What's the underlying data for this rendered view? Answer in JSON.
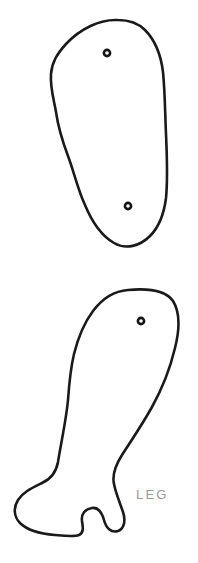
{
  "document": {
    "title": "LEG",
    "background_color": "#ffffff",
    "ink_color": "#1a1a1a",
    "label_color": "#9a9a9a",
    "width": 198,
    "height": 563
  },
  "labels": {
    "leg": "LEG"
  },
  "pieces": [
    {
      "id": "upper-piece",
      "name": "leg-pattern-piece-upper",
      "label": "",
      "holes": 2
    },
    {
      "id": "lower-piece",
      "name": "leg-pattern-piece-lower",
      "label": "LEG",
      "holes": 1
    }
  ],
  "holes": [
    {
      "name": "joint-hole-upper-top",
      "cx": 107,
      "cy": 53,
      "r": 3.1
    },
    {
      "name": "joint-hole-upper-bottom",
      "cx": 128,
      "cy": 206,
      "r": 3.1
    },
    {
      "name": "joint-hole-lower-top",
      "cx": 141,
      "cy": 321,
      "r": 3.1
    }
  ]
}
